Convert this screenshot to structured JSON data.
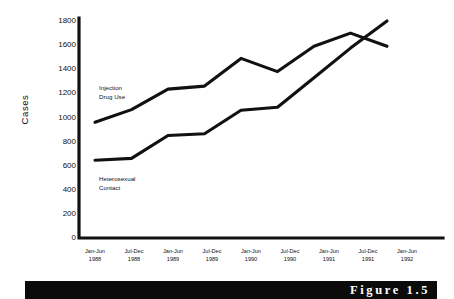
{
  "figure": {
    "caption": "Figure 1.5",
    "caption_banner_color": "#0b0b0b",
    "caption_text_color": "#ffffff"
  },
  "chart_data": {
    "type": "line",
    "title": "",
    "xlabel": "",
    "ylabel": "Cases",
    "ylim": [
      0,
      1800
    ],
    "yticks": [
      0,
      200,
      400,
      600,
      800,
      1000,
      1200,
      1400,
      1600,
      1800
    ],
    "grid": false,
    "legend_position": "inline-annotation",
    "line_color": "#111111",
    "categories": [
      "Jan-Jun 1988",
      "Jul-Dec 1988",
      "Jan-Jun 1989",
      "Jul-Dec 1989",
      "Jan-Jun 1990",
      "Jul-Dec 1990",
      "Jan-Jun 1991",
      "Jul-Dec 1991",
      "Jan-Jun 1992"
    ],
    "category_lines": [
      [
        "Jan-Jun",
        "1988"
      ],
      [
        "Jul-Dec",
        "1988"
      ],
      [
        "Jan-Jun",
        "1989"
      ],
      [
        "Jul-Dec",
        "1989"
      ],
      [
        "Jan-Jun",
        "1990"
      ],
      [
        "Jul-Dec",
        "1990"
      ],
      [
        "Jan-Jun",
        "1991"
      ],
      [
        "Jul-Dec",
        "1991"
      ],
      [
        "Jan-Jun",
        "1992"
      ]
    ],
    "series": [
      {
        "name": "Injection Drug Use",
        "label_lines": [
          "Injection",
          "Drug Use"
        ],
        "values": [
          960,
          1065,
          1235,
          1260,
          1490,
          1380,
          1590,
          1700,
          1590
        ]
      },
      {
        "name": "Heterosexual Contact",
        "label_lines": [
          "Heterosexual",
          "Contact"
        ],
        "values": [
          645,
          660,
          850,
          865,
          1060,
          1085,
          1330,
          1575,
          1800
        ]
      }
    ]
  },
  "axis": {
    "y_tick_labels": [
      "1800",
      "1600",
      "1400",
      "1200",
      "1000",
      "800",
      "600",
      "400",
      "200",
      "0"
    ]
  }
}
